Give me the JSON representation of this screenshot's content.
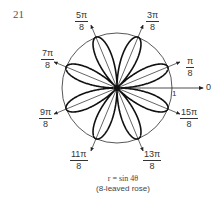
{
  "problem_number": "21",
  "equation": "r = sin 4θ",
  "subtitle": "(8-leaved rose)",
  "axis": {
    "zero_label": "0",
    "unit_label": "1"
  },
  "angle_labels": [
    {
      "num": "π",
      "den": "8",
      "x": 186,
      "y": 57
    },
    {
      "num": "3π",
      "den": "8",
      "x": 146,
      "y": 11
    },
    {
      "num": "5π",
      "den": "8",
      "x": 75,
      "y": 11
    },
    {
      "num": "7π",
      "den": "8",
      "x": 41,
      "y": 49
    },
    {
      "num": "9π",
      "den": "8",
      "x": 39,
      "y": 108
    },
    {
      "num": "11π",
      "den": "8",
      "x": 70,
      "y": 150
    },
    {
      "num": "13π",
      "den": "8",
      "x": 143,
      "y": 150
    },
    {
      "num": "15π",
      "den": "8",
      "x": 180,
      "y": 108
    }
  ],
  "colors": {
    "ink": "#111111",
    "circle": "#444444",
    "text": "#333333"
  },
  "geometry": {
    "cx": 117,
    "cy": 88,
    "radius": 55,
    "petals": 8
  }
}
